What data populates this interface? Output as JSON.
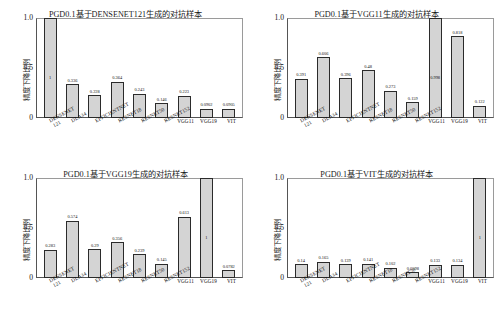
{
  "figure": {
    "layout": "2x2 grid of bar charts",
    "shared_ylabel": "精度下降比例",
    "shared_categories": [
      "DENSENET121",
      "DLA34",
      "EFFICIENTNET",
      "RESNET18",
      "RESNET50",
      "RESNET152",
      "VGG11",
      "VGG19",
      "VIT"
    ],
    "ytick_labels": [
      "1.0",
      "0.5",
      "0"
    ]
  },
  "chart_data": [
    {
      "type": "bar",
      "title": "PGD0.1基于DENSENET121生成的对抗样本",
      "xlabel": "",
      "ylabel": "精度下降比例",
      "ylim": [
        0,
        1.0
      ],
      "grid": false,
      "legend": "none",
      "categories": [
        "DENSENET121",
        "DLA34",
        "EFFICIENTNET",
        "RESNET18",
        "RESNET50",
        "RESNET152",
        "VGG11",
        "VGG19",
        "VIT"
      ],
      "values": [
        1,
        0.336,
        0.228,
        0.364,
        0.243,
        0.146,
        0.223,
        0.0902,
        0.0905
      ],
      "value_labels": [
        "1",
        "0.336",
        "0.228",
        "0.364",
        "0.243",
        "0.146",
        "0.223",
        "0.0902",
        "0.0905"
      ]
    },
    {
      "type": "bar",
      "title": "PGD0.1基于VGG11生成的对抗样本",
      "xlabel": "",
      "ylabel": "精度下降比例",
      "ylim": [
        0,
        1.0
      ],
      "grid": false,
      "legend": "none",
      "categories": [
        "DENSENET121",
        "DLA34",
        "EFFICIENTNET",
        "RESNET18",
        "RESNET50",
        "RESNET152",
        "VGG11",
        "VGG19",
        "VIT"
      ],
      "values": [
        0.391,
        0.606,
        0.396,
        0.48,
        0.273,
        0.159,
        0.998,
        0.818,
        0.122
      ],
      "value_labels": [
        "0.391",
        "0.606",
        "0.396",
        "0.48",
        "0.273",
        "0.159",
        "0.998",
        "0.818",
        "0.122"
      ]
    },
    {
      "type": "bar",
      "title": "PGD0.1基于VGG19生成的对抗样本",
      "xlabel": "",
      "ylabel": "精度下降比例",
      "ylim": [
        0,
        1.0
      ],
      "grid": false,
      "legend": "none",
      "categories": [
        "DENSENET121",
        "DLA34",
        "EFFICIENTNET",
        "RESNET18",
        "RESNET50",
        "RESNET152",
        "VGG11",
        "VGG19",
        "VIT"
      ],
      "values": [
        0.283,
        0.574,
        0.29,
        0.356,
        0.239,
        0.145,
        0.613,
        1,
        0.0782
      ],
      "value_labels": [
        "0.283",
        "0.574",
        "0.29",
        "0.356",
        "0.239",
        "0.145",
        "0.613",
        "1",
        "0.0782"
      ]
    },
    {
      "type": "bar",
      "title": "PGD0.1基于VIT生成的对抗样本",
      "xlabel": "",
      "ylabel": "精度下降比例",
      "ylim": [
        0,
        1.0
      ],
      "grid": false,
      "legend": "none",
      "categories": [
        "DENSENET121",
        "DLA34",
        "EFFICIENTNET",
        "RESNET18",
        "RESNET50",
        "RESNET152",
        "VGG11",
        "VGG19",
        "VIT"
      ],
      "values": [
        0.14,
        0.165,
        0.139,
        0.141,
        0.102,
        0.0598,
        0.133,
        0.134,
        1
      ],
      "value_labels": [
        "0.14",
        "0.165",
        "0.139",
        "0.141",
        "0.102",
        "0.0598",
        "0.133",
        "0.134",
        "1"
      ]
    }
  ],
  "colors": {
    "bar_fill": "#d4d4d4",
    "bar_edge": "#2b2b2b",
    "axis": "#555555",
    "text": "#111111",
    "background": "#ffffff"
  }
}
